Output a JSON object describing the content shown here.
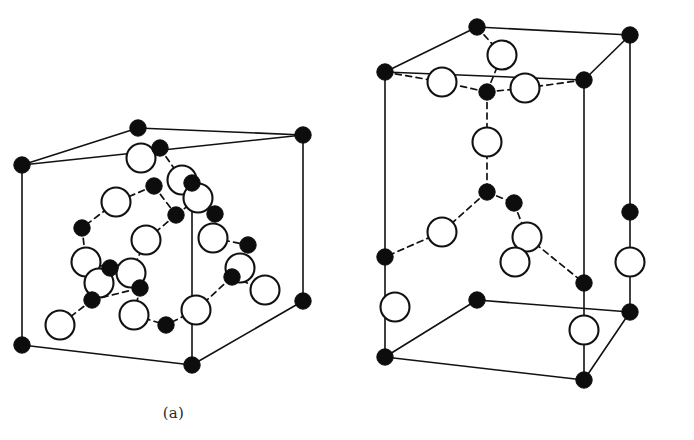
{
  "figure": {
    "background_color": "#ffffff",
    "line_color": "#111111",
    "filled_atom_color": "#0d0d0d",
    "open_atom_color": "#ffffff",
    "width": 694,
    "height": 440
  },
  "panels": [
    {
      "id": "a",
      "caption": "(a)",
      "structure_name": "zincblende",
      "cell_shape": "cube",
      "viewport": {
        "width": 347,
        "height": 440
      }
    },
    {
      "id": "b",
      "caption": "(b)",
      "structure_name": "wurtzite",
      "cell_shape": "hexagonal-prism-cell",
      "viewport": {
        "width": 347,
        "height": 440
      }
    }
  ],
  "legend": {
    "filled_atom_label": "filled circle",
    "open_atom_label": "open circle",
    "bond_label": "dashed bond",
    "cell_edge_label": "solid cell edge"
  },
  "geometry": {
    "panel_a": {
      "cell_vertices": {
        "front_bottom_left": [
          22,
          345
        ],
        "front_bottom_right": [
          303,
          301
        ],
        "front_top_left": [
          22,
          165
        ],
        "front_top_right": [
          303,
          135
        ],
        "back_bottom_left": [
          138,
          306
        ],
        "back_bottom_right": [
          192,
          365
        ],
        "back_top_left": [
          138,
          128
        ],
        "back_top_right": [
          192,
          183
        ]
      },
      "cell_edges": [
        [
          "front_top_left",
          "front_top_right"
        ],
        [
          "front_top_left",
          "back_top_left"
        ],
        [
          "back_top_left",
          "front_top_right"
        ],
        [
          "front_top_left",
          "front_bottom_left"
        ],
        [
          "front_top_right",
          "front_bottom_right"
        ],
        [
          "front_bottom_left",
          "back_bottom_right"
        ],
        [
          "back_bottom_right",
          "front_bottom_right"
        ],
        [
          "back_top_right",
          "back_bottom_right"
        ]
      ],
      "filled_atoms": [
        [
          22,
          165
        ],
        [
          138,
          128
        ],
        [
          303,
          135
        ],
        [
          192,
          183
        ],
        [
          22,
          345
        ],
        [
          192,
          365
        ],
        [
          303,
          301
        ],
        [
          160,
          148
        ],
        [
          154,
          186
        ],
        [
          176,
          215
        ],
        [
          82,
          228
        ],
        [
          110,
          268
        ],
        [
          92,
          300
        ],
        [
          215,
          214
        ],
        [
          248,
          245
        ],
        [
          232,
          277
        ],
        [
          140,
          288
        ],
        [
          166,
          325
        ]
      ],
      "open_atoms": [
        [
          141,
          158
        ],
        [
          182,
          180
        ],
        [
          116,
          202
        ],
        [
          146,
          240
        ],
        [
          198,
          198
        ],
        [
          86,
          262
        ],
        [
          99,
          283
        ],
        [
          213,
          238
        ],
        [
          240,
          268
        ],
        [
          265,
          290
        ],
        [
          134,
          315
        ],
        [
          196,
          310
        ],
        [
          60,
          325
        ],
        [
          131,
          273
        ]
      ],
      "bonds": [
        [
          [
            160,
            148
          ],
          [
            141,
            158
          ]
        ],
        [
          [
            160,
            148
          ],
          [
            182,
            180
          ]
        ],
        [
          [
            176,
            215
          ],
          [
            146,
            240
          ]
        ],
        [
          [
            176,
            215
          ],
          [
            198,
            198
          ]
        ],
        [
          [
            154,
            186
          ],
          [
            116,
            202
          ]
        ],
        [
          [
            116,
            202
          ],
          [
            82,
            228
          ]
        ],
        [
          [
            82,
            228
          ],
          [
            86,
            262
          ]
        ],
        [
          [
            86,
            262
          ],
          [
            110,
            268
          ]
        ],
        [
          [
            110,
            268
          ],
          [
            99,
            283
          ]
        ],
        [
          [
            99,
            283
          ],
          [
            92,
            300
          ]
        ],
        [
          [
            92,
            300
          ],
          [
            60,
            325
          ]
        ],
        [
          [
            146,
            240
          ],
          [
            131,
            273
          ]
        ],
        [
          [
            131,
            273
          ],
          [
            140,
            288
          ]
        ],
        [
          [
            140,
            288
          ],
          [
            134,
            315
          ]
        ],
        [
          [
            134,
            315
          ],
          [
            166,
            325
          ]
        ],
        [
          [
            198,
            198
          ],
          [
            215,
            214
          ]
        ],
        [
          [
            215,
            214
          ],
          [
            213,
            238
          ]
        ],
        [
          [
            213,
            238
          ],
          [
            248,
            245
          ]
        ],
        [
          [
            248,
            245
          ],
          [
            240,
            268
          ]
        ],
        [
          [
            240,
            268
          ],
          [
            232,
            277
          ]
        ],
        [
          [
            232,
            277
          ],
          [
            265,
            290
          ]
        ],
        [
          [
            196,
            310
          ],
          [
            166,
            325
          ]
        ],
        [
          [
            196,
            310
          ],
          [
            232,
            277
          ]
        ],
        [
          [
            92,
            300
          ],
          [
            140,
            288
          ]
        ],
        [
          [
            154,
            186
          ],
          [
            176,
            215
          ]
        ],
        [
          [
            182,
            180
          ],
          [
            198,
            198
          ]
        ]
      ]
    },
    "panel_b": {
      "cell_vertices": {
        "front_bottom_left": [
          38,
          357
        ],
        "front_bottom_right": [
          237,
          380
        ],
        "front_top_left": [
          38,
          72
        ],
        "front_top_right": [
          237,
          80
        ],
        "back_bottom_left": [
          130,
          300
        ],
        "back_bottom_right": [
          283,
          312
        ],
        "back_top_left": [
          130,
          27
        ],
        "back_top_right": [
          283,
          35
        ]
      },
      "cell_edges": [
        [
          "front_top_left",
          "back_top_left"
        ],
        [
          "back_top_left",
          "back_top_right"
        ],
        [
          "back_top_right",
          "front_top_right"
        ],
        [
          "front_top_left",
          "front_top_right"
        ],
        [
          "front_top_left",
          "front_bottom_left"
        ],
        [
          "front_top_right",
          "front_bottom_right"
        ],
        [
          "back_top_right",
          "back_bottom_right"
        ],
        [
          "front_bottom_left",
          "back_bottom_left"
        ],
        [
          "back_bottom_left",
          "back_bottom_right"
        ],
        [
          "front_bottom_left",
          "front_bottom_right"
        ],
        [
          "front_bottom_right",
          "back_bottom_right"
        ]
      ],
      "filled_atoms": [
        [
          130,
          27
        ],
        [
          283,
          35
        ],
        [
          38,
          72
        ],
        [
          237,
          80
        ],
        [
          38,
          257
        ],
        [
          38,
          357
        ],
        [
          130,
          300
        ],
        [
          237,
          283
        ],
        [
          237,
          380
        ],
        [
          283,
          212
        ],
        [
          283,
          312
        ],
        [
          140,
          92
        ],
        [
          140,
          192
        ],
        [
          167,
          203
        ]
      ],
      "open_atoms": [
        [
          155,
          55
        ],
        [
          95,
          82
        ],
        [
          178,
          88
        ],
        [
          140,
          142
        ],
        [
          95,
          232
        ],
        [
          180,
          237
        ],
        [
          168,
          262
        ],
        [
          48,
          307
        ],
        [
          237,
          330
        ],
        [
          283,
          262
        ]
      ],
      "bonds": [
        [
          [
            130,
            27
          ],
          [
            155,
            55
          ]
        ],
        [
          [
            140,
            92
          ],
          [
            95,
            82
          ]
        ],
        [
          [
            140,
            92
          ],
          [
            178,
            88
          ]
        ],
        [
          [
            140,
            92
          ],
          [
            155,
            55
          ]
        ],
        [
          [
            140,
            92
          ],
          [
            140,
            142
          ]
        ],
        [
          [
            140,
            142
          ],
          [
            140,
            192
          ]
        ],
        [
          [
            140,
            192
          ],
          [
            95,
            232
          ]
        ],
        [
          [
            140,
            192
          ],
          [
            167,
            203
          ]
        ],
        [
          [
            167,
            203
          ],
          [
            180,
            237
          ]
        ],
        [
          [
            180,
            237
          ],
          [
            237,
            283
          ]
        ],
        [
          [
            95,
            232
          ],
          [
            38,
            257
          ]
        ],
        [
          [
            38,
            72
          ],
          [
            95,
            82
          ]
        ],
        [
          [
            237,
            80
          ],
          [
            178,
            88
          ]
        ],
        [
          [
            180,
            237
          ],
          [
            168,
            262
          ]
        ]
      ]
    }
  }
}
